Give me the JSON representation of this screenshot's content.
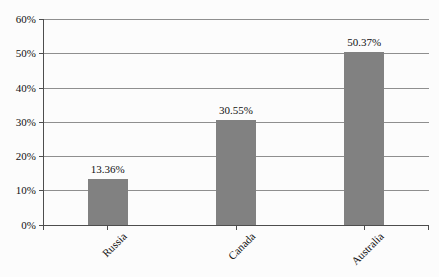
{
  "chart_data": {
    "type": "bar",
    "title": "",
    "xlabel": "",
    "ylabel": "",
    "categories": [
      "Russia",
      "Canada",
      "Australia"
    ],
    "values": [
      13.36,
      30.55,
      50.37
    ],
    "value_labels": [
      "13.36%",
      "30.55%",
      "50.37%"
    ],
    "y_axis": {
      "min": 0,
      "max": 60,
      "step": 10,
      "tick_labels": [
        "0%",
        "10%",
        "20%",
        "30%",
        "40%",
        "50%",
        "60%"
      ]
    },
    "grid": true,
    "legend": false,
    "colors": {
      "bar_fill": "#818181",
      "gridline": "#8f8f8f",
      "axis": "#4d4d4d",
      "text": "#111111",
      "background": "#fcfcfc"
    }
  }
}
